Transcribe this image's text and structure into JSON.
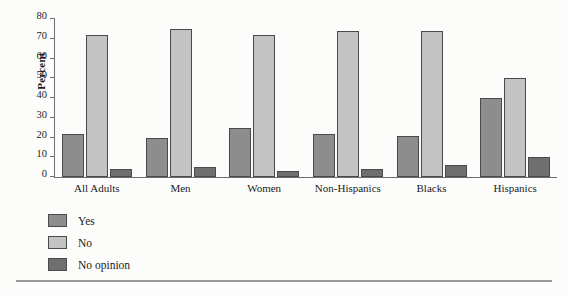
{
  "chart_data": {
    "type": "bar",
    "title": "",
    "subtitle": "",
    "xlabel": "",
    "ylabel": "Percent",
    "ylim": [
      0,
      80
    ],
    "yticks": [
      0,
      10,
      20,
      30,
      40,
      50,
      60,
      70,
      80
    ],
    "grid": false,
    "legend_position": "bottom-left",
    "categories": [
      "All Adults",
      "Men",
      "Women",
      "Non-Hispanics",
      "Blacks",
      "Hispanics"
    ],
    "series": [
      {
        "name": "Yes",
        "color": "#8d8d8d",
        "values": [
          22,
          20,
          25,
          22,
          21,
          40
        ]
      },
      {
        "name": "No",
        "color": "#c3c3c3",
        "values": [
          72,
          75,
          72,
          74,
          74,
          50
        ]
      },
      {
        "name": "No opinion",
        "color": "#6f6f6f",
        "values": [
          4,
          5,
          3,
          4,
          6,
          10
        ]
      }
    ]
  },
  "axis": {
    "y_label": "Percent"
  },
  "legend": {
    "items": [
      {
        "label": "Yes"
      },
      {
        "label": "No"
      },
      {
        "label": "No opinion"
      }
    ]
  }
}
